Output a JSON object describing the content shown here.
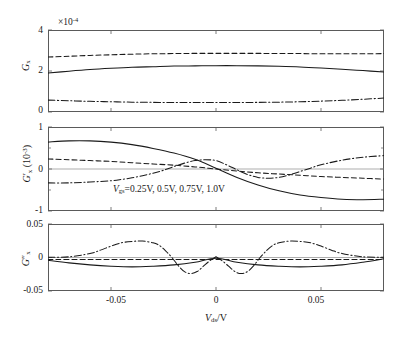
{
  "figure": {
    "xlabel": "V_ds/V",
    "xlabel_parts": {
      "main": "V",
      "sub": "ds",
      "tail": "/V"
    },
    "legend": "V_gs=0.25V, 0.5V, 0.75V, 1.0V",
    "legend_parts": {
      "main": "V",
      "sub": "gs",
      "tail": "=0.25V, 0.5V, 0.75V, 1.0V"
    },
    "x_ticks": [
      "-0.05",
      "0",
      "0.05"
    ],
    "x_tick_values": [
      -0.05,
      0,
      0.05
    ],
    "xlim": [
      -0.08,
      0.08
    ],
    "line_colors": {
      "curve": "#1a1a1a",
      "axis": "#5a5a5a",
      "zero": "#8a8a8a"
    }
  },
  "chart_data": [
    {
      "type": "line",
      "panel": 1,
      "title": "",
      "xlabel": "",
      "ylabel": "G_x",
      "ylabel_parts": {
        "main": "G",
        "sub": "x",
        "primes": ""
      },
      "y_multiplier": "×10⁻⁴",
      "y_multiplier_parts": {
        "base": "×10",
        "exp": "-4"
      },
      "ylim": [
        0,
        4
      ],
      "y_ticks": [
        "0",
        "2",
        "4"
      ],
      "y_tick_values": [
        0,
        2,
        4
      ],
      "xlim": [
        -0.08,
        0.08
      ],
      "grid": false,
      "legend_position": "none",
      "series": [
        {
          "name": "Vgs=0.5V",
          "style": "dashed",
          "x": [
            -0.08,
            -0.07,
            -0.06,
            -0.05,
            -0.04,
            -0.03,
            -0.02,
            -0.01,
            0,
            0.01,
            0.02,
            0.03,
            0.04,
            0.05,
            0.06,
            0.07,
            0.08
          ],
          "values": [
            2.68,
            2.72,
            2.76,
            2.79,
            2.82,
            2.84,
            2.85,
            2.86,
            2.86,
            2.86,
            2.86,
            2.85,
            2.85,
            2.84,
            2.84,
            2.84,
            2.85
          ]
        },
        {
          "name": "Vgs=0.75V",
          "style": "solid",
          "x": [
            -0.08,
            -0.07,
            -0.06,
            -0.05,
            -0.04,
            -0.03,
            -0.02,
            -0.01,
            0,
            0.01,
            0.02,
            0.03,
            0.04,
            0.05,
            0.06,
            0.07,
            0.08
          ],
          "values": [
            1.9,
            1.99,
            2.07,
            2.13,
            2.18,
            2.21,
            2.24,
            2.25,
            2.26,
            2.26,
            2.25,
            2.23,
            2.2,
            2.15,
            2.09,
            2.02,
            1.95
          ]
        },
        {
          "name": "Vgs=1.0V",
          "style": "dashdot",
          "x": [
            -0.08,
            -0.07,
            -0.06,
            -0.05,
            -0.04,
            -0.03,
            -0.02,
            -0.01,
            0,
            0.01,
            0.02,
            0.03,
            0.04,
            0.05,
            0.06,
            0.07,
            0.08
          ],
          "values": [
            0.58,
            0.55,
            0.52,
            0.5,
            0.48,
            0.47,
            0.46,
            0.46,
            0.46,
            0.46,
            0.47,
            0.48,
            0.5,
            0.53,
            0.57,
            0.62,
            0.68
          ]
        }
      ]
    },
    {
      "type": "line",
      "panel": 2,
      "title": "",
      "xlabel": "",
      "ylabel": "G'_x (10^-3)",
      "ylabel_parts": {
        "main": "G",
        "sub": "x",
        "primes": "′",
        "unit": "(10",
        "unit_exp": "-3",
        "unit_tail": ")"
      },
      "y_multiplier": "",
      "ylim": [
        -1,
        1
      ],
      "y_ticks": [
        "1",
        "0",
        "-1"
      ],
      "y_tick_values": [
        1,
        0,
        -1
      ],
      "xlim": [
        -0.08,
        0.08
      ],
      "grid": false,
      "legend_position": "inside-lower-left",
      "series": [
        {
          "name": "Vgs=0.75V",
          "style": "solid",
          "x": [
            -0.08,
            -0.07,
            -0.06,
            -0.05,
            -0.04,
            -0.03,
            -0.02,
            -0.01,
            0,
            0.01,
            0.02,
            0.03,
            0.04,
            0.05,
            0.06,
            0.07,
            0.08
          ],
          "values": [
            0.64,
            0.67,
            0.67,
            0.64,
            0.58,
            0.49,
            0.38,
            0.23,
            0.02,
            -0.2,
            -0.38,
            -0.52,
            -0.62,
            -0.68,
            -0.72,
            -0.73,
            -0.72
          ]
        },
        {
          "name": "Vgs=0.5V",
          "style": "dashed",
          "x": [
            -0.08,
            -0.07,
            -0.06,
            -0.05,
            -0.04,
            -0.03,
            -0.02,
            -0.01,
            0,
            0.01,
            0.02,
            0.03,
            0.04,
            0.05,
            0.06,
            0.07,
            0.08
          ],
          "values": [
            0.24,
            0.22,
            0.2,
            0.18,
            0.15,
            0.12,
            0.09,
            0.05,
            0.0,
            -0.05,
            -0.09,
            -0.12,
            -0.15,
            -0.18,
            -0.2,
            -0.22,
            -0.24
          ]
        },
        {
          "name": "Vgs=1.0V",
          "style": "dashdot",
          "x": [
            -0.08,
            -0.07,
            -0.06,
            -0.05,
            -0.045,
            -0.04,
            -0.035,
            -0.03,
            -0.025,
            -0.02,
            -0.015,
            -0.01,
            -0.005,
            0,
            0.005,
            0.01,
            0.015,
            0.02,
            0.025,
            0.03,
            0.035,
            0.04,
            0.045,
            0.05,
            0.06,
            0.07,
            0.08
          ],
          "values": [
            -0.33,
            -0.33,
            -0.31,
            -0.28,
            -0.25,
            -0.21,
            -0.16,
            -0.1,
            -0.03,
            0.06,
            0.14,
            0.2,
            0.22,
            0.2,
            0.1,
            -0.02,
            -0.13,
            -0.2,
            -0.22,
            -0.2,
            -0.14,
            -0.06,
            0.02,
            0.1,
            0.21,
            0.28,
            0.32
          ]
        }
      ]
    },
    {
      "type": "line",
      "panel": 3,
      "title": "",
      "xlabel": "V_ds/V",
      "ylabel": "G''_x",
      "ylabel_parts": {
        "main": "G",
        "sub": "x",
        "primes": "″"
      },
      "y_multiplier": "",
      "ylim": [
        -0.05,
        0.05
      ],
      "y_ticks": [
        "0.05",
        "0",
        "-0.05"
      ],
      "y_tick_values": [
        0.05,
        0,
        -0.05
      ],
      "xlim": [
        -0.08,
        0.08
      ],
      "grid": false,
      "legend_position": "none",
      "series": [
        {
          "name": "Vgs=0.75V",
          "style": "solid",
          "x": [
            -0.08,
            -0.07,
            -0.06,
            -0.05,
            -0.04,
            -0.03,
            -0.02,
            -0.01,
            0,
            0.01,
            0.02,
            0.03,
            0.04,
            0.05,
            0.06,
            0.07,
            0.08
          ],
          "values": [
            -0.004,
            -0.008,
            -0.011,
            -0.013,
            -0.014,
            -0.013,
            -0.011,
            -0.007,
            -0.001,
            -0.007,
            -0.011,
            -0.013,
            -0.014,
            -0.013,
            -0.011,
            -0.007,
            -0.002
          ]
        },
        {
          "name": "Vgs=0.5V",
          "style": "dashed",
          "x": [
            -0.08,
            -0.06,
            -0.04,
            -0.02,
            0,
            0.02,
            0.04,
            0.06,
            0.08
          ],
          "values": [
            -0.003,
            -0.003,
            -0.003,
            -0.003,
            -0.003,
            -0.003,
            -0.003,
            -0.003,
            -0.003
          ]
        },
        {
          "name": "Vgs=1.0V-a",
          "style": "dashdot",
          "x": [
            -0.08,
            -0.07,
            -0.06,
            -0.055,
            -0.05,
            -0.045,
            -0.04,
            -0.035,
            -0.03,
            -0.027,
            -0.024,
            -0.021,
            -0.018,
            -0.015,
            -0.012,
            -0.009,
            -0.006,
            -0.003,
            0
          ],
          "values": [
            0.0005,
            0.001,
            0.006,
            0.011,
            0.017,
            0.022,
            0.024,
            0.0245,
            0.022,
            0.018,
            0.01,
            0.0,
            -0.012,
            -0.021,
            -0.024,
            -0.021,
            -0.013,
            -0.005,
            0.001
          ]
        },
        {
          "name": "Vgs=1.0V-b",
          "style": "dashdot",
          "x": [
            0,
            0.003,
            0.006,
            0.009,
            0.012,
            0.015,
            0.018,
            0.021,
            0.024,
            0.027,
            0.03,
            0.035,
            0.04,
            0.045,
            0.05,
            0.055,
            0.06,
            0.07,
            0.08
          ],
          "values": [
            0.001,
            -0.005,
            -0.013,
            -0.021,
            -0.024,
            -0.021,
            -0.012,
            0.0,
            0.01,
            0.018,
            0.022,
            0.0245,
            0.024,
            0.022,
            0.017,
            0.011,
            0.006,
            0.001,
            0.0005
          ]
        }
      ]
    }
  ]
}
